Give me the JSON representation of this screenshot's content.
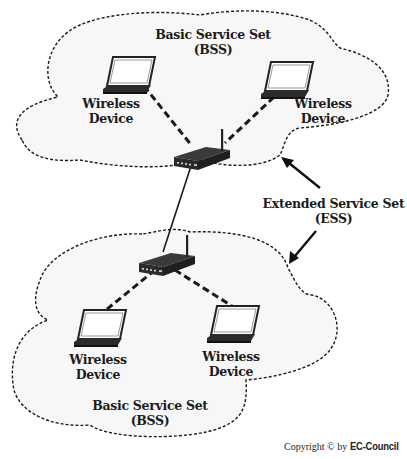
{
  "diagram": {
    "top_bss": {
      "label_line1": "Basic Service Set",
      "label_line2": "(BSS)",
      "devices": [
        {
          "line1": "Wireless",
          "line2": "Device"
        },
        {
          "line1": "Wireless",
          "line2": "Device"
        }
      ],
      "access_point": "router-icon"
    },
    "bottom_bss": {
      "label_line1": "Basic Service Set",
      "label_line2": "(BSS)",
      "devices": [
        {
          "line1": "Wireless",
          "line2": "Device"
        },
        {
          "line1": "Wireless",
          "line2": "Device"
        }
      ],
      "access_point": "router-icon"
    },
    "ess": {
      "label_line1": "Extended Service Set",
      "label_line2": "(ESS)"
    },
    "copyright": {
      "prefix": "Copyright © by",
      "brand": "EC-Council"
    },
    "colors": {
      "cloud_fill": "#f7f7f7",
      "outline": "#1a1a1a",
      "device": "#2a2a2a"
    }
  }
}
